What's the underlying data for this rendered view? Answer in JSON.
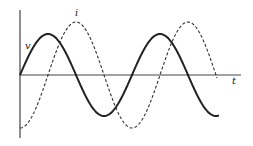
{
  "diagram": {
    "title": "",
    "labels": {
      "voltage": "v",
      "current": "i",
      "time": "t"
    },
    "colors": {
      "ink": "#222222",
      "background": "#ffffff"
    },
    "axes": {
      "origin_x": 20,
      "origin_y": 75,
      "x_end": 241,
      "y_top": 10,
      "y_bottom": 138
    },
    "curves": [
      {
        "name": "voltage",
        "label": "v",
        "style": "solid",
        "amplitude": 41,
        "period": 112,
        "phase_deg": 0,
        "x_start": 20,
        "x_end": 219
      },
      {
        "name": "current",
        "label": "i",
        "style": "dashed",
        "amplitude": 53,
        "period": 112,
        "phase_deg": -90,
        "x_start": 20,
        "x_end": 217
      }
    ]
  }
}
